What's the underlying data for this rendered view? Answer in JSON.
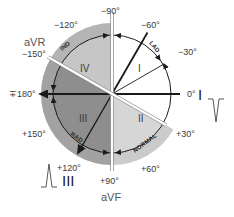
{
  "diagram": {
    "center": {
      "x": 112,
      "y": 94
    },
    "colors": {
      "white_region": "#ffffff",
      "quadrant_I": "#ffffff",
      "quadrant_II": "#d6d6d6",
      "quadrant_III": "#8e8e8e",
      "quadrant_IV": "#c6c6c6",
      "outer_ring_II": "#c9c9c9",
      "outer_ring_III": "#a2a2a2",
      "outer_ring_IV": "#b4b4b4",
      "axis_line": "#1a1a1a",
      "divider": "#ffffff",
      "text": "#3a3a3a"
    },
    "angle_labels": [
      {
        "id": "neg90",
        "text": "−90°"
      },
      {
        "id": "neg60",
        "text": "−60°"
      },
      {
        "id": "neg30",
        "text": "−30°"
      },
      {
        "id": "zero",
        "text": "0°"
      },
      {
        "id": "pos30",
        "text": "+30°"
      },
      {
        "id": "pos60",
        "text": "+60°"
      },
      {
        "id": "pos90",
        "text": "+90°"
      },
      {
        "id": "pos120",
        "text": "+120°"
      },
      {
        "id": "pos150",
        "text": "+150°"
      },
      {
        "id": "pm180",
        "text": "∓180°"
      },
      {
        "id": "neg150",
        "text": "−150°"
      },
      {
        "id": "neg120",
        "text": "−120°"
      }
    ],
    "leads": {
      "aVR": "aVR",
      "aVF": "aVF",
      "I": "I",
      "III": "III"
    },
    "quadrants": {
      "I": "I",
      "II": "II",
      "III": "III",
      "IV": "IV"
    },
    "arc_labels": {
      "lad": "LAD",
      "normal": "NORMAL",
      "rad": "RAD",
      "ind": "IND"
    },
    "waveforms": {
      "lead_I": "negative-deflection",
      "lead_III": "positive-deflection"
    }
  }
}
